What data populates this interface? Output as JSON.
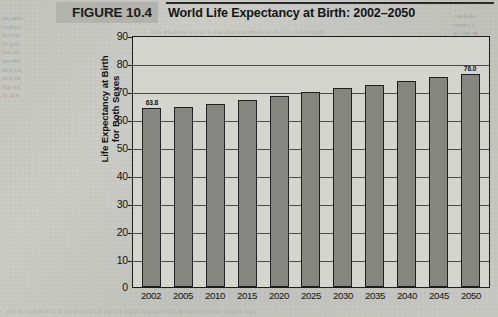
{
  "figure": {
    "tag": "FIGURE 10.4",
    "title": "World Life Expectancy at Birth: 2002–2050"
  },
  "axis": {
    "y_title_line1": "Life Expectancy at Birth",
    "y_title_line2": "for Both Sexes",
    "y_ticks": [
      "90",
      "80",
      "70",
      "60",
      "50",
      "40",
      "30",
      "20",
      "10",
      "0"
    ]
  },
  "bleed_text": {
    "left": "anomic\ncompe\nworld\nly gre\nfor ex\nanomi\nand ca\nand th\nthe ex\nin the",
    "right": "conside\nterms o\nof the m\nand de\nwhich a\nand fo\nare vis\nof con\nmany",
    "under": "The modern world is the Durkheimian end of a continuum\nsocieties that have no division of labor\nstructure of the different and the\ncould that not all of the split\nnumber and will form",
    "bottom": "and the community of the population and the social structure that the society of the modern state"
  },
  "chart_data": {
    "type": "bar",
    "title": "World Life Expectancy at Birth: 2002–2050",
    "xlabel": "",
    "ylabel": "Life Expectancy at Birth for Both Sexes",
    "ylim": [
      0,
      90
    ],
    "ytick_step": 10,
    "grid": true,
    "legend": "none",
    "bar_color": "#878782",
    "categories": [
      "2002",
      "2005",
      "2010",
      "2015",
      "2020",
      "2025",
      "2030",
      "2035",
      "2040",
      "2045",
      "2050"
    ],
    "values": [
      63.8,
      64.4,
      65.5,
      66.7,
      68.1,
      69.6,
      70.9,
      72.1,
      73.5,
      74.9,
      76.0
    ],
    "data_labels": [
      {
        "category": "2002",
        "text": "63.8"
      },
      {
        "category": "2050",
        "text": "76.0"
      }
    ]
  }
}
